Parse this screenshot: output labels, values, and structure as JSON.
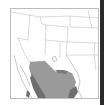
{
  "map": {
    "type": "range-map",
    "region": "Southwestern United States and Northern Mexico",
    "colors": {
      "background": "#ffffff",
      "frame": "#bdbdbd",
      "boundaries": "#c8c8c8",
      "range_primary": "#9a9a9a",
      "range_secondary": "#6e6e6e",
      "edge_strip": "#2a2a2a"
    },
    "legend": []
  }
}
